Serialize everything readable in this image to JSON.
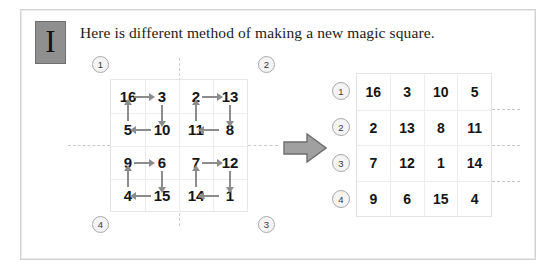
{
  "page": {
    "badge_letter": "I",
    "title": "Here is different method of making a new magic square.",
    "border_color": "#d2d2d2",
    "background": "#ffffff",
    "accent_gray": "#8f8f8f"
  },
  "quadrant_labels": [
    {
      "id": "q1",
      "text": "1",
      "position": "top-left"
    },
    {
      "id": "q2",
      "text": "2",
      "position": "top-right"
    },
    {
      "id": "q3",
      "text": "3",
      "position": "bottom-right"
    },
    {
      "id": "q4",
      "text": "4",
      "position": "bottom-left"
    }
  ],
  "source_grid": {
    "rows": [
      [
        "16",
        "3",
        "2",
        "13"
      ],
      [
        "5",
        "10",
        "11",
        "8"
      ],
      [
        "9",
        "6",
        "7",
        "12"
      ],
      [
        "4",
        "15",
        "14",
        "1"
      ]
    ],
    "arrow_color": "#8c8c8c",
    "arrows": [
      {
        "from": "16",
        "to": "3",
        "direction": "right"
      },
      {
        "from": "3",
        "to": "10",
        "direction": "down"
      },
      {
        "from": "10",
        "to": "5",
        "direction": "left"
      },
      {
        "from": "5",
        "to": "16",
        "direction": "up"
      },
      {
        "from": "2",
        "to": "13",
        "direction": "right"
      },
      {
        "from": "13",
        "to": "8",
        "direction": "down"
      },
      {
        "from": "8",
        "to": "11",
        "direction": "left"
      },
      {
        "from": "11",
        "to": "2",
        "direction": "up"
      },
      {
        "from": "9",
        "to": "6",
        "direction": "right"
      },
      {
        "from": "6",
        "to": "15",
        "direction": "down"
      },
      {
        "from": "15",
        "to": "4",
        "direction": "left"
      },
      {
        "from": "4",
        "to": "9",
        "direction": "up"
      },
      {
        "from": "7",
        "to": "12",
        "direction": "right"
      },
      {
        "from": "12",
        "to": "1",
        "direction": "down"
      },
      {
        "from": "1",
        "to": "14",
        "direction": "left"
      },
      {
        "from": "14",
        "to": "7",
        "direction": "up"
      }
    ]
  },
  "transform_arrow": {
    "direction": "right",
    "fill": "#a0a0a0",
    "stroke": "#6e6e6e"
  },
  "result_table": {
    "row_markers": [
      "1",
      "2",
      "3",
      "4"
    ],
    "rows": [
      [
        "16",
        "3",
        "10",
        "5"
      ],
      [
        "2",
        "13",
        "8",
        "11"
      ],
      [
        "7",
        "12",
        "1",
        "14"
      ],
      [
        "9",
        "6",
        "15",
        "4"
      ]
    ]
  }
}
